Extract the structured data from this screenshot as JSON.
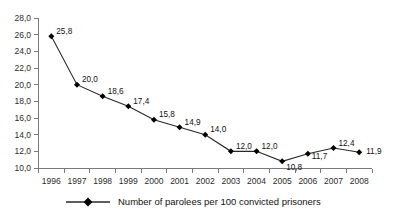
{
  "chart_data": {
    "type": "line",
    "title": "",
    "subtitle": "",
    "xlabel": "",
    "ylabel": "",
    "categories": [
      "1996",
      "1997",
      "1998",
      "1999",
      "2000",
      "2001",
      "2002",
      "2003",
      "2004",
      "2005",
      "2006",
      "2007",
      "2008"
    ],
    "values": [
      25.8,
      20.0,
      18.6,
      17.4,
      15.8,
      14.9,
      14.0,
      12.0,
      12.0,
      10.8,
      11.7,
      12.4,
      11.9
    ],
    "point_labels": [
      "25,8",
      "20,0",
      "18,6",
      "17,4",
      "15,8",
      "14,9",
      "14,0",
      "12,0",
      "12,0",
      "10,8",
      "11,7",
      "12,4",
      "11,9"
    ],
    "series": [
      {
        "name": "Number of parolees per 100 convicted prisoners",
        "values": [
          25.8,
          20.0,
          18.6,
          17.4,
          15.8,
          14.9,
          14.0,
          12.0,
          12.0,
          10.8,
          11.7,
          12.4,
          11.9
        ]
      }
    ],
    "ylim": [
      10.0,
      28.0
    ],
    "ytick_step": 2.0,
    "ytick_labels": [
      "28,0",
      "26,0",
      "24,0",
      "22,0",
      "20,0",
      "18,0",
      "16,0",
      "14,0",
      "12,0",
      "10,0"
    ],
    "ytick_values": [
      28.0,
      26.0,
      24.0,
      22.0,
      20.0,
      18.0,
      16.0,
      14.0,
      12.0,
      10.0
    ],
    "grid": false,
    "legend_position": "bottom",
    "marker": "diamond",
    "decimal_separator": ",",
    "line_color": "#2a2a2a",
    "marker_color": "#000000",
    "axis_color": "#7a7a7a"
  },
  "legend": {
    "entries": [
      {
        "label": "Number of parolees per 100 convicted prisoners",
        "marker": "diamond",
        "color": "#000000"
      }
    ]
  }
}
